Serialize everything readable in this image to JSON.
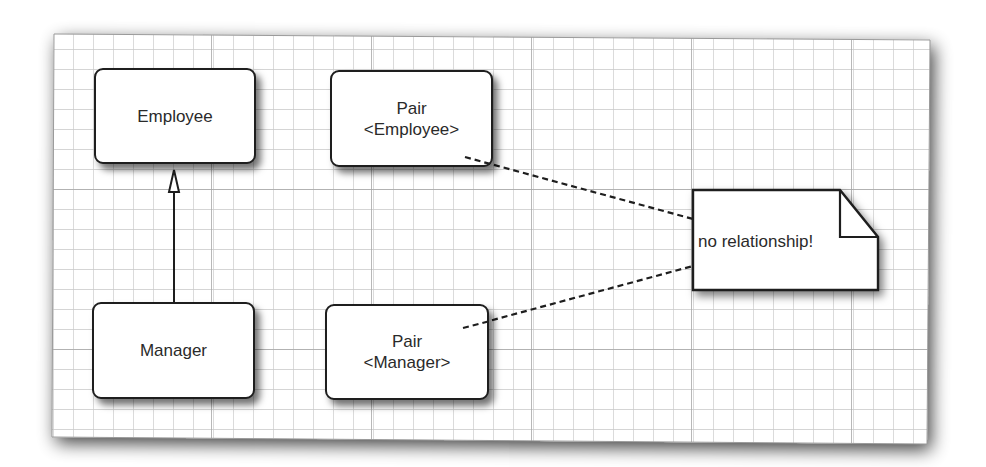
{
  "diagram": {
    "type": "uml-class-diagram",
    "colors": {
      "paper": "#ffffff",
      "grid_minor": "#c8c8c8",
      "grid_major": "#a8a8a8",
      "stroke": "#1e1e1e",
      "text": "#2a2a2a"
    },
    "classes": [
      {
        "id": "employee",
        "lines": [
          "Employee"
        ]
      },
      {
        "id": "manager",
        "lines": [
          "Manager"
        ]
      },
      {
        "id": "pair-employee",
        "lines": [
          "Pair",
          "<Employee>"
        ]
      },
      {
        "id": "pair-manager",
        "lines": [
          "Pair",
          "<Manager>"
        ]
      }
    ],
    "note": {
      "text": "no relationship!"
    },
    "relationships": [
      {
        "type": "generalization",
        "from": "Manager",
        "to": "Employee"
      },
      {
        "type": "note-anchor",
        "from": "Pair<Employee>",
        "to": "no relationship!"
      },
      {
        "type": "note-anchor",
        "from": "Pair<Manager>",
        "to": "no relationship!"
      }
    ]
  }
}
